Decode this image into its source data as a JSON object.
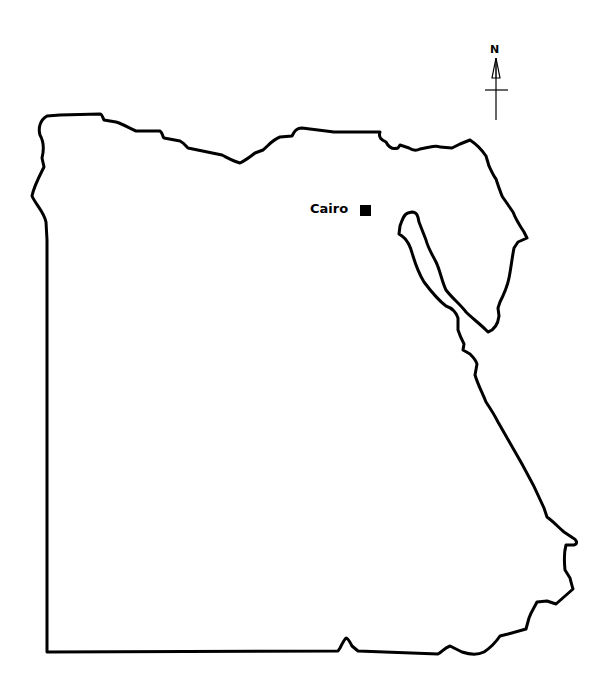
{
  "map": {
    "region": "Egypt",
    "outline_color": "#000000",
    "background_color": "#ffffff",
    "cities": [
      {
        "name": "Cairo",
        "marker": "filled-square"
      }
    ],
    "compass": {
      "label": "N",
      "icon": "north-arrow-icon"
    }
  }
}
